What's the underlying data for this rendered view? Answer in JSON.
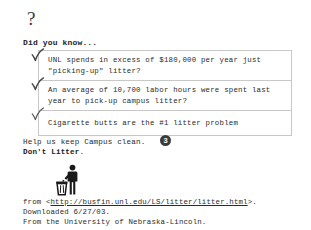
{
  "document": {
    "question_mark": "?",
    "heading": "Did you know...",
    "facts": [
      {
        "check_icon": "checkmark-icon",
        "text": "UNL spends in excess of $180,000 per year just\n\"picking-up\" litter?"
      },
      {
        "check_icon": "checkmark-icon",
        "text": "An average of 10,700 labor hours were spent last\nyear to pick-up campus litter?"
      },
      {
        "check_icon": "checkmark-icon",
        "text": "Cigarette butts are the #1 litter problem"
      }
    ],
    "closing": {
      "line1": "Help us keep Campus clean.",
      "line2_bold": "Don't Litter",
      "line2_tail": "."
    },
    "badge": {
      "label": "3",
      "icon": "circled-number-badge",
      "color": "#3b3b3b"
    },
    "pictogram": {
      "icon": "person-using-trash-can-icon",
      "color": "#1a1a1a"
    },
    "footer": {
      "line1_prefix": "from <",
      "url": "http://busfin.unl.edu/LS/litter/litter.html",
      "line1_suffix": ">.",
      "line2": "Downloaded 6/27/03.",
      "line3": "From the University of Nebraska-Lincoln."
    }
  }
}
